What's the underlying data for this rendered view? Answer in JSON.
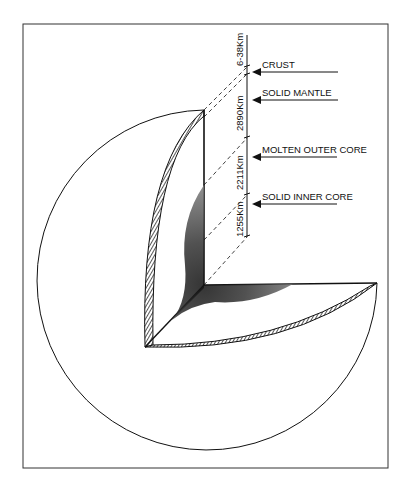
{
  "diagram": {
    "title": "",
    "layers": [
      {
        "name": "CRUST",
        "thickness": "6-38Km"
      },
      {
        "name": "SOLID MANTLE",
        "thickness": "2890Km"
      },
      {
        "name": "MOLTEN OUTER CORE",
        "thickness": "2211Km"
      },
      {
        "name": "SOLID INNER CORE",
        "thickness": "1255Km"
      }
    ],
    "colors": {
      "line": "#111111",
      "background": "#ffffff"
    }
  }
}
